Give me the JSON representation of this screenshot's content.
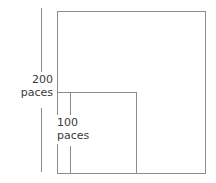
{
  "diagram": {
    "background_color": "#ffffff",
    "line_color": "#8c8c8c",
    "text_color": "#3a3a3a",
    "outer_square": {
      "name": "outer-square",
      "side_label_value": "200",
      "side_label_unit": "paces",
      "x": 57,
      "y": 11,
      "width": 149,
      "height": 163
    },
    "inner_square": {
      "name": "inner-square",
      "side_label_value": "100",
      "side_label_unit": "paces",
      "x": 57,
      "y": 92,
      "width": 80,
      "height": 82
    },
    "outer_dimension": {
      "name": "outer-dimension-line",
      "value": "200",
      "unit": "paces",
      "x": 41,
      "top": 8,
      "bottom": 172
    },
    "inner_dimension": {
      "name": "inner-dimension-line",
      "value": "100",
      "unit": "paces",
      "x": 70,
      "top": 92,
      "bottom": 174
    }
  }
}
